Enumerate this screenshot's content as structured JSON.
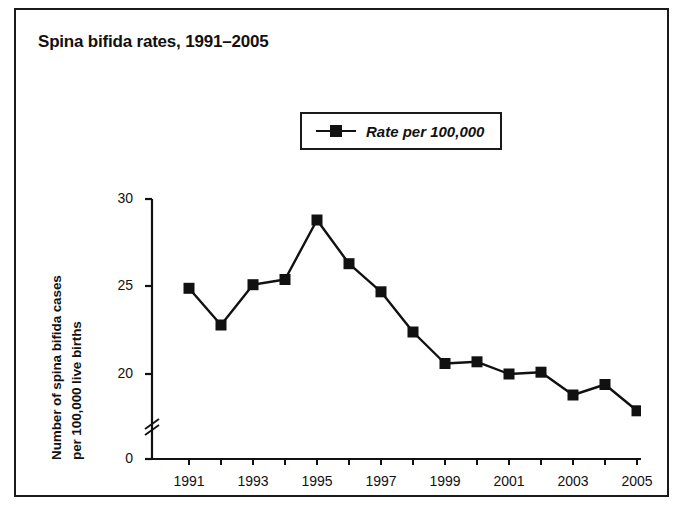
{
  "chart_data": {
    "type": "line",
    "title": "Spina bifida rates, 1991–2005",
    "xlabel": "",
    "ylabel_lines": [
      "Number of spina bifida cases",
      "per 100,000 live births"
    ],
    "legend": {
      "position": "top-center-inside",
      "entries": [
        {
          "name": "Rate per 100,000",
          "marker": "filled-square",
          "color": "#111111"
        }
      ]
    },
    "x": [
      1991,
      1992,
      1993,
      1994,
      1995,
      1996,
      1997,
      1998,
      1999,
      2000,
      2001,
      2002,
      2003,
      2004,
      2005
    ],
    "categories": [
      "1991",
      "1992",
      "1993",
      "1994",
      "1995",
      "1996",
      "1997",
      "1998",
      "1999",
      "2000",
      "2001",
      "2002",
      "2003",
      "2004",
      "2005"
    ],
    "series": [
      {
        "name": "Rate per 100,000",
        "values": [
          24.9,
          22.8,
          25.1,
          25.4,
          28.8,
          26.3,
          24.7,
          22.4,
          20.6,
          20.7,
          20.0,
          20.1,
          18.8,
          19.4,
          17.9
        ]
      }
    ],
    "xtick_labels_shown": [
      "1991",
      "1993",
      "1995",
      "1997",
      "1999",
      "2001",
      "2003",
      "2005"
    ],
    "xtick_all_years": true,
    "ylim": [
      0,
      30
    ],
    "ytick_labels": [
      "0",
      "20",
      "25",
      "30"
    ],
    "y_axis_break": true,
    "y_axis_break_note": "axis break between 0 and 20",
    "grid": false,
    "line_color": "#111111",
    "marker_color": "#111111",
    "background": "#ffffff",
    "border_color": "#1a1a1a"
  }
}
